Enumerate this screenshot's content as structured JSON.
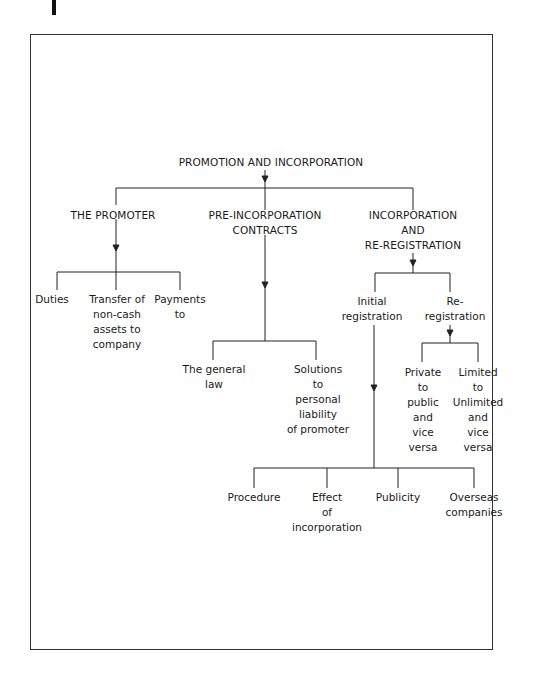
{
  "diagram": {
    "root": "PROMOTION AND INCORPORATION",
    "branches": [
      {
        "label": "THE PROMOTER",
        "children": [
          "Duties",
          "Transfer of\nnon-cash\nassets to\ncompany",
          "Payments\nto"
        ]
      },
      {
        "label": "PRE-INCORPORATION\nCONTRACTS",
        "children": [
          "The general\nlaw",
          "Solutions\nto\npersonal\nliability\nof promoter"
        ]
      },
      {
        "label": "INCORPORATION\nAND\nRE-REGISTRATION",
        "children": [
          {
            "label": "Initial\nregistration",
            "children": [
              "Procedure",
              "Effect\nof\nincorporation",
              "Publicity",
              "Overseas\ncompanies"
            ]
          },
          {
            "label": "Re-\nregistration",
            "children": [
              "Private\nto\npublic\nand\nvice\nversa",
              "Limited\nto\nUnlimited\nand\nvice\nversa"
            ]
          }
        ]
      }
    ]
  },
  "colors": {
    "line": "#222222",
    "frame": "#333333",
    "text": "#1a1a1a"
  }
}
